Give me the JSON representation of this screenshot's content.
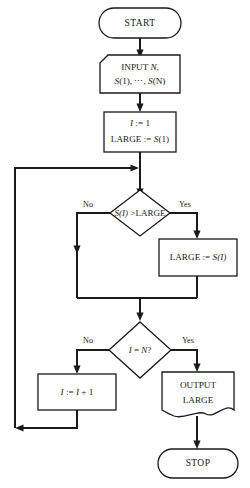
{
  "diagram": {
    "type": "flowchart",
    "background_color": "#ffffff",
    "line_color": "#1a1a1a",
    "fill_color": "#ffffff"
  },
  "nodes": {
    "start": {
      "shape": "terminal",
      "label": "START"
    },
    "input": {
      "shape": "manual-input",
      "line1_pre": "INPUT ",
      "line1_var": "N",
      "line1_post": ",",
      "line2_a": "S",
      "line2_b": "(1), ",
      "line2_dots": "⋯",
      "line2_c": ", ",
      "line2_d": "S",
      "line2_e": "(N)",
      "text_full": "INPUT N, S(1), ⋯, S(N)"
    },
    "init": {
      "shape": "process",
      "line1_var": "I",
      "line1_rest": " := 1",
      "line2_pre": "LARGE := ",
      "line2_var": "S",
      "line2_post": "(1)",
      "text_full": "I := 1 / LARGE := S(1)"
    },
    "decision1": {
      "shape": "decision",
      "var": "S",
      "idx": "(I)",
      "op": " >LARGE",
      "text_full": "S(I) >LARGE",
      "branch_no": "No",
      "branch_yes": "Yes"
    },
    "assign_large": {
      "shape": "process",
      "pre": "LARGE := ",
      "var": "S",
      "post": "(I)",
      "text_full": "LARGE := S(I)"
    },
    "decision2": {
      "shape": "decision",
      "var1": "I",
      "mid": " = ",
      "var2": "N",
      "post": "?",
      "text_full": "I = N?",
      "branch_no": "No",
      "branch_yes": "Yes"
    },
    "increment": {
      "shape": "process",
      "var1": "I",
      "mid": " := ",
      "var2": "I",
      "post": " + 1",
      "text_full": "I := I + 1"
    },
    "output": {
      "shape": "document",
      "line1": "OUTPUT",
      "line2": "LARGE",
      "text_full": "OUTPUT LARGE"
    },
    "stop": {
      "shape": "terminal",
      "label": "STOP"
    }
  },
  "edges": [
    {
      "from": "start",
      "to": "input",
      "label": ""
    },
    {
      "from": "input",
      "to": "init",
      "label": ""
    },
    {
      "from": "init",
      "to": "decision1",
      "label": ""
    },
    {
      "from": "decision1",
      "to": "merge1",
      "label": "No"
    },
    {
      "from": "decision1",
      "to": "assign_large",
      "label": "Yes"
    },
    {
      "from": "assign_large",
      "to": "merge1",
      "label": ""
    },
    {
      "from": "merge1",
      "to": "decision2",
      "label": ""
    },
    {
      "from": "decision2",
      "to": "increment",
      "label": "No"
    },
    {
      "from": "decision2",
      "to": "output",
      "label": "Yes"
    },
    {
      "from": "increment",
      "to": "loopback",
      "label": ""
    },
    {
      "from": "loopback",
      "to": "decision1",
      "label": ""
    },
    {
      "from": "output",
      "to": "stop",
      "label": ""
    }
  ]
}
